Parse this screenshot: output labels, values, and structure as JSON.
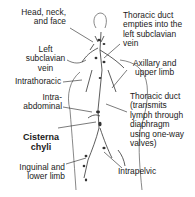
{
  "diagram": {
    "title": "",
    "labels_left": [
      {
        "id": "head-neck-face",
        "lines": [
          "Head, neck,",
          "and face"
        ]
      },
      {
        "id": "left-subclavian",
        "lines": [
          "Left",
          "subclavian",
          "vein"
        ]
      },
      {
        "id": "intrathoracic",
        "lines": [
          "Intrathoracic"
        ]
      },
      {
        "id": "intra-abdominal",
        "lines": [
          "Intra-",
          "abdominal"
        ]
      },
      {
        "id": "cisterna-chyli",
        "lines": [
          "Cisterna",
          "chyli"
        ]
      },
      {
        "id": "inguinal-lower-limb",
        "lines": [
          "Inguinal and",
          "lower limb"
        ]
      }
    ],
    "labels_right": [
      {
        "id": "thoracic-duct-empties",
        "lines": [
          "Thoracic duct",
          "empties into the",
          "left subclavian",
          "vein"
        ]
      },
      {
        "id": "axillary-upper-limb",
        "lines": [
          "Axillary and",
          "upper limb"
        ]
      },
      {
        "id": "thoracic-duct-transmits",
        "lines": [
          "Thoracic duct",
          "(transmits",
          "lymph through",
          "diaphragm",
          "using one-way",
          "valves)"
        ]
      },
      {
        "id": "intrapelvic",
        "lines": [
          "Intrapelvic"
        ]
      }
    ],
    "colors": {
      "line": "#333333",
      "figure": "#555555",
      "text": "#1a1a1a"
    }
  }
}
